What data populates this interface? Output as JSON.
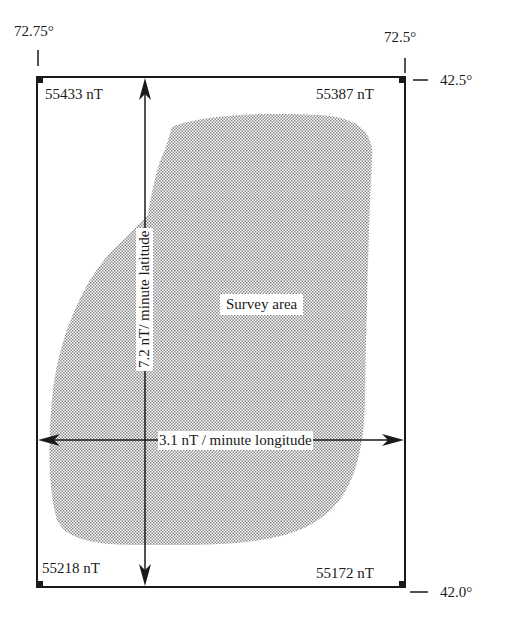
{
  "diagram": {
    "type": "survey-area-gradient-map",
    "colors": {
      "line": "#1a1a1a",
      "stipple": "#9a9a9a",
      "background": "#ffffff"
    },
    "coordinates": {
      "lon_left": "72.75°",
      "lon_right": "72.5°",
      "lat_top": "42.5°",
      "lat_bottom": "42.0°"
    },
    "corners": {
      "top_left": "55433 nT",
      "top_right": "55387 nT",
      "bottom_left": "55218 nT",
      "bottom_right": "55172 nT"
    },
    "gradients": {
      "latitude": "7.2 nT/ minute latitude",
      "longitude": "3.1 nT / minute longitude"
    },
    "region_label": "Survey area"
  }
}
